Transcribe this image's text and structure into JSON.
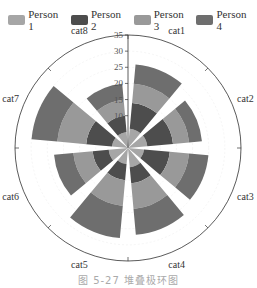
{
  "chart_data": {
    "type": "polar-stacked-bar",
    "title": "",
    "caption": "图 5-27  堆叠极环图",
    "categories": [
      "cat1",
      "cat2",
      "cat3",
      "cat4",
      "cat5",
      "cat6",
      "cat7",
      "cat8"
    ],
    "series": [
      {
        "name": "Person 1",
        "color": "#a6a6a6",
        "values": [
          6,
          6,
          5,
          6,
          5,
          6,
          5,
          5
        ]
      },
      {
        "name": "Person 2",
        "color": "#4d4d4d",
        "values": [
          8,
          8,
          8,
          5,
          5,
          5,
          8,
          5
        ]
      },
      {
        "name": "Person 3",
        "color": "#999999",
        "values": [
          6,
          5,
          6,
          8,
          8,
          6,
          9,
          5
        ]
      },
      {
        "name": "Person 4",
        "color": "#6e6e6e",
        "values": [
          6,
          4,
          6,
          8,
          10,
          6,
          8,
          5
        ]
      }
    ],
    "radial_ticks": [
      10,
      15,
      20,
      25,
      30,
      35
    ],
    "radial_range": [
      0,
      35
    ],
    "legend_position": "top",
    "grid": true
  },
  "legend": [
    {
      "label": "Person 1",
      "color": "#a6a6a6"
    },
    {
      "label": "Person 2",
      "color": "#4d4d4d"
    },
    {
      "label": "Person 3",
      "color": "#999999"
    },
    {
      "label": "Person 4",
      "color": "#6e6e6e"
    }
  ]
}
